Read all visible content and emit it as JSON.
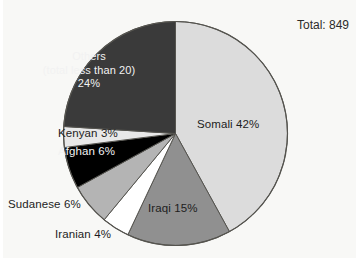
{
  "title": {
    "total_label": "Total: 849"
  },
  "chart_data": {
    "type": "pie",
    "title": "Total: 849",
    "total": 849,
    "total_label": "Total: 849",
    "xlabel": "",
    "ylabel": "",
    "legend_position": "none",
    "grid": false,
    "start_angle_deg": 0,
    "direction": "clockwise",
    "categories": [
      "Somali",
      "Iraqi",
      "Iranian",
      "Sudanese",
      "Afghan",
      "Kenyan",
      "Others"
    ],
    "values": [
      42,
      15,
      4,
      6,
      6,
      3,
      24
    ],
    "value_unit": "percent",
    "slices": [
      {
        "name": "Somali",
        "label": "Somali 42%",
        "percent": 42,
        "color": "#dcdcdc",
        "label_placement": "inside",
        "label_color": "#1d1d1d"
      },
      {
        "name": "Iraqi",
        "label": "Iraqi 15%",
        "percent": 15,
        "color": "#909090",
        "label_placement": "inside",
        "label_color": "#1d1d1d"
      },
      {
        "name": "Iranian",
        "label": "Iranian 4%",
        "percent": 4,
        "color": "#ffffff",
        "label_placement": "outside",
        "label_color": "#2b2b2b"
      },
      {
        "name": "Sudanese",
        "label": "Sudanese 6%",
        "percent": 6,
        "color": "#b4b4b4",
        "label_placement": "outside",
        "label_color": "#2b2b2b"
      },
      {
        "name": "Afghan",
        "label": "Afghan 6%",
        "percent": 6,
        "color": "#000000",
        "label_placement": "inside",
        "label_color": "#f2f2f2"
      },
      {
        "name": "Kenyan",
        "label": "Kenyan 3%",
        "percent": 3,
        "color": "#e8e8e8",
        "label_placement": "inside",
        "label_color": "#1d1d1d"
      },
      {
        "name": "Others",
        "label": "Others (total less than 20) 24%",
        "label_line1": "Others",
        "label_line2": "(total less than 20)",
        "label_line3": "24%",
        "percent": 24,
        "color": "#3a3a3a",
        "label_placement": "inside",
        "label_color": "#f2f2f2"
      }
    ],
    "colors": {
      "background": "#f8f8f6",
      "outline": "#55544f",
      "text": "#2b2b2b",
      "somali": "#dcdcdc",
      "iraqi": "#909090",
      "iranian": "#ffffff",
      "sudanese": "#b4b4b4",
      "afghan": "#000000",
      "kenyan": "#e8e8e8",
      "others": "#3a3a3a"
    }
  },
  "labels": {
    "somali": "Somali 42%",
    "iraqi": "Iraqi 15%",
    "iranian": "Iranian 4%",
    "sudanese": "Sudanese 6%",
    "afghan": "Afghan 6%",
    "kenyan": "Kenyan 3%",
    "others_line1": "Others",
    "others_line2": "(total less than 20)",
    "others_line3": "24%"
  }
}
